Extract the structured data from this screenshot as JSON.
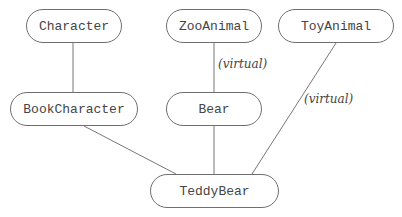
{
  "diagram": {
    "nodes": [
      {
        "id": "character",
        "label": "Character",
        "x": 26,
        "y": 9,
        "w": 96,
        "h": 34
      },
      {
        "id": "zooanimal",
        "label": "ZooAnimal",
        "x": 166,
        "y": 9,
        "w": 96,
        "h": 34
      },
      {
        "id": "toyanimal",
        "label": "ToyAnimal",
        "x": 278,
        "y": 9,
        "w": 116,
        "h": 34
      },
      {
        "id": "bookcharacter",
        "label": "BookCharacter",
        "x": 10,
        "y": 92,
        "w": 128,
        "h": 34
      },
      {
        "id": "bear",
        "label": "Bear",
        "x": 166,
        "y": 92,
        "w": 96,
        "h": 34
      },
      {
        "id": "teddybear",
        "label": "TeddyBear",
        "x": 150,
        "y": 174,
        "w": 129,
        "h": 34
      }
    ],
    "edges": [
      {
        "from": "character",
        "to": "bookcharacter",
        "label": ""
      },
      {
        "from": "zooanimal",
        "to": "bear",
        "label": "(virtual)"
      },
      {
        "from": "toyanimal",
        "to": "teddybear",
        "label": "(virtual)"
      },
      {
        "from": "bookcharacter",
        "to": "teddybear",
        "label": ""
      },
      {
        "from": "bear",
        "to": "teddybear",
        "label": ""
      }
    ],
    "edge_labels": {
      "zoo_bear": "(virtual)",
      "toy_teddy": "(virtual)"
    }
  }
}
